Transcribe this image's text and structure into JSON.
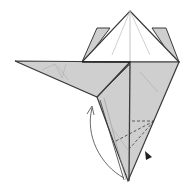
{
  "diagram": {
    "type": "origami-fold-step",
    "colors": {
      "background": "#ffffff",
      "paper_colored": "#cfcfcf",
      "paper_white": "#ffffff",
      "edge": "#3a3a3a",
      "crease": "#9a9a9a",
      "arrow": "#444444",
      "push_arrow": "#222222"
    },
    "elements": [
      {
        "name": "top-point-white-layer",
        "description": "White triangular top point"
      },
      {
        "name": "back-flap-left",
        "description": "Colored flap behind top point, left"
      },
      {
        "name": "back-flap-right",
        "description": "Colored flap behind top point, right"
      },
      {
        "name": "left-wing-flap",
        "description": "Long colored flap pointing left"
      },
      {
        "name": "main-body",
        "description": "Colored kite-shaped body tapering to bottom point"
      },
      {
        "name": "valley-fold-dashed-lines",
        "description": "Dashed fold lines on lower body"
      },
      {
        "name": "fold-arrow",
        "description": "Curved arrow from bottom point up toward left flap"
      },
      {
        "name": "push-arrow",
        "description": "Black triangular push/sink indicator"
      }
    ]
  }
}
